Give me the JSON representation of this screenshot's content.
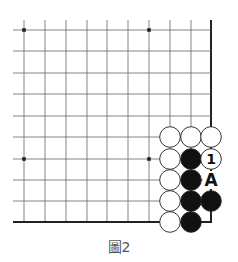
{
  "diagram": {
    "caption": "圖2",
    "grid": {
      "columns_x": [
        24,
        45,
        66,
        87,
        107,
        128,
        149,
        170,
        191,
        211
      ],
      "rows_y": [
        30,
        51,
        73,
        94,
        116,
        137,
        159,
        180,
        201,
        222
      ],
      "line_left": 13,
      "line_top": 20,
      "right_edge_x": 211,
      "bottom_edge_y": 222
    },
    "star_points": [
      {
        "col": 0,
        "row": 0
      },
      {
        "col": 6,
        "row": 0
      },
      {
        "col": 0,
        "row": 6
      },
      {
        "col": 6,
        "row": 6
      }
    ],
    "stones": [
      {
        "color": "white",
        "col": 7,
        "row": 5,
        "label": ""
      },
      {
        "color": "white",
        "col": 8,
        "row": 5,
        "label": ""
      },
      {
        "color": "white",
        "col": 9,
        "row": 5,
        "label": ""
      },
      {
        "color": "white",
        "col": 7,
        "row": 6,
        "label": ""
      },
      {
        "color": "black",
        "col": 8,
        "row": 6,
        "label": ""
      },
      {
        "color": "white",
        "col": 9,
        "row": 6,
        "label": "1"
      },
      {
        "color": "white",
        "col": 7,
        "row": 7,
        "label": ""
      },
      {
        "color": "black",
        "col": 8,
        "row": 7,
        "label": ""
      },
      {
        "color": "white",
        "col": 7,
        "row": 8,
        "label": ""
      },
      {
        "color": "black",
        "col": 8,
        "row": 8,
        "label": ""
      },
      {
        "color": "black",
        "col": 9,
        "row": 8,
        "label": ""
      },
      {
        "color": "white",
        "col": 7,
        "row": 9,
        "label": ""
      },
      {
        "color": "black",
        "col": 8,
        "row": 9,
        "label": ""
      }
    ],
    "labels": [
      {
        "text": "A",
        "col": 9,
        "row": 7
      }
    ],
    "colors": {
      "line": "#666666",
      "edge": "#222222",
      "black_stone": "#111111",
      "white_stone": "#ffffff",
      "stone_outline": "#222222"
    }
  }
}
